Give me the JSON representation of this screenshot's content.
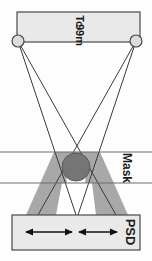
{
  "figure": {
    "orientation": "rotated-90",
    "labels": {
      "source": "Tc-99m",
      "source_line1": "Tc-",
      "source_line2": "99m",
      "mask": "Mask",
      "detector": "PSD"
    },
    "colors": {
      "background": "#fdfdfd",
      "outline": "#4a4a4a",
      "box_fill": "#e9e9e9",
      "shadow_fill": "#a8a8a8",
      "absorber_fill": "#757575",
      "ray_stroke": "#3a3a3a",
      "mask_line": "#6e6e6e",
      "arrow": "#111111",
      "source_marker_fill": "#dcdcdc",
      "label_text": "#1a1a1a"
    },
    "source_bar": {
      "x": 17,
      "y": 12,
      "width": 123,
      "height": 30
    },
    "point_sources": [
      {
        "name": "left-source",
        "cx": 18,
        "cy": 41,
        "r": 6
      },
      {
        "name": "right-source",
        "cx": 136,
        "cy": 41,
        "r": 6
      }
    ],
    "mask": {
      "line_top_y": 152,
      "line_bottom_y": 183,
      "absorber": {
        "cx": 76,
        "cy": 167,
        "r": 14
      }
    },
    "detector": {
      "x": 12,
      "y": 215,
      "width": 128,
      "height": 35,
      "label": "PSD"
    },
    "ray_crossing": {
      "x": 76,
      "y": 140
    },
    "arrows": [
      {
        "name": "wide-span-arrow",
        "x1": 26,
        "x2": 72,
        "y": 232,
        "double_headed": true
      },
      {
        "name": "narrow-span-arrow",
        "x1": 78,
        "x2": 118,
        "y": 232,
        "double_headed": true
      }
    ],
    "shadow_cones": [
      {
        "name": "left-shadow-cone",
        "apex_cx": 18
      },
      {
        "name": "right-shadow-cone",
        "apex_cx": 136
      }
    ]
  }
}
